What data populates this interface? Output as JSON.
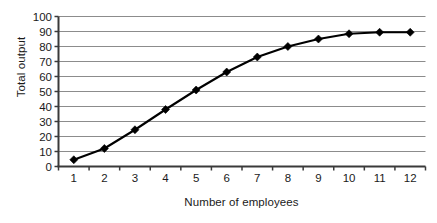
{
  "chart_data": {
    "type": "line",
    "title": "",
    "xlabel": "Number of employees",
    "ylabel": "Total output",
    "x": [
      1,
      2,
      3,
      4,
      5,
      6,
      7,
      8,
      9,
      10,
      11,
      12
    ],
    "values": [
      4.5,
      12,
      24.5,
      38,
      51,
      63,
      73,
      80,
      85,
      88.5,
      89.5,
      89.5
    ],
    "series": [
      {
        "name": "Total output",
        "values": [
          4.5,
          12,
          24.5,
          38,
          51,
          63,
          73,
          80,
          85,
          88.5,
          89.5,
          89.5
        ]
      }
    ],
    "categories": [
      "1",
      "2",
      "3",
      "4",
      "5",
      "6",
      "7",
      "8",
      "9",
      "10",
      "11",
      "12"
    ],
    "xtick_labels": [
      "1",
      "2",
      "3",
      "4",
      "5",
      "6",
      "7",
      "8",
      "9",
      "10",
      "11",
      "12"
    ],
    "ytick_labels": [
      "0",
      "10",
      "20",
      "30",
      "40",
      "50",
      "60",
      "70",
      "80",
      "90",
      "100"
    ],
    "ytick_values": [
      0,
      10,
      20,
      30,
      40,
      50,
      60,
      70,
      80,
      90,
      100
    ],
    "ylim": [
      0,
      100
    ],
    "xlim": [
      0.5,
      12.5
    ],
    "grid": "horizontal",
    "legend": "none",
    "marker": "diamond",
    "colors": {
      "line": "#000000",
      "marker": "#000000",
      "gridline": "#8c8c8c",
      "axis": "#3a3a3a",
      "text": "#1a1a1a",
      "background": "#ffffff"
    }
  }
}
